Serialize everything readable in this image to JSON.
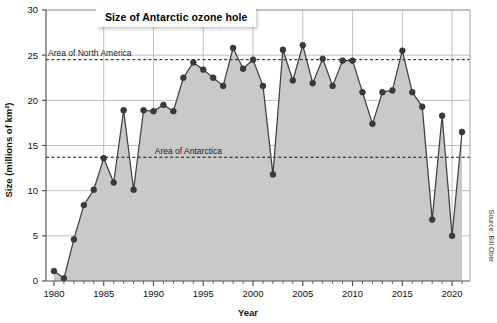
{
  "chart_data": {
    "type": "area",
    "title": "Size of Antarctic ozone hole",
    "xlabel": "Year",
    "ylabel": "Size (millions of km²)",
    "xlim": [
      1979.2,
      2021.8
    ],
    "ylim": [
      0,
      30
    ],
    "grid": true,
    "legend_position": "none",
    "source": "Source: Bill Ober",
    "x_ticks": [
      1980,
      1985,
      1990,
      1995,
      2000,
      2005,
      2010,
      2015,
      2020
    ],
    "x_tick_labels": [
      "1980",
      "1985",
      "1990",
      "1995",
      "2000",
      "2005",
      "2010",
      "2015",
      "2020"
    ],
    "y_ticks": [
      0,
      5,
      10,
      15,
      20,
      25,
      30
    ],
    "y_tick_labels": [
      "0",
      "5",
      "10",
      "15",
      "20",
      "25",
      "30"
    ],
    "x": [
      1980,
      1981,
      1982,
      1983,
      1984,
      1985,
      1986,
      1987,
      1988,
      1989,
      1990,
      1991,
      1992,
      1993,
      1994,
      1995,
      1996,
      1997,
      1998,
      1999,
      2000,
      2001,
      2002,
      2003,
      2004,
      2005,
      2006,
      2007,
      2008,
      2009,
      2010,
      2011,
      2012,
      2013,
      2014,
      2015,
      2016,
      2017,
      2018,
      2019,
      2020,
      2021
    ],
    "values": [
      1.1,
      0.3,
      4.6,
      8.4,
      10.1,
      13.6,
      10.9,
      18.9,
      10.1,
      18.9,
      18.8,
      19.5,
      18.8,
      22.5,
      24.2,
      23.4,
      22.5,
      21.6,
      25.8,
      23.5,
      24.5,
      21.6,
      11.8,
      25.6,
      22.2,
      26.1,
      21.9,
      24.6,
      21.6,
      24.4,
      24.4,
      20.9,
      17.4,
      20.9,
      21.1,
      25.5,
      20.9,
      19.3,
      6.8,
      18.3,
      5.0,
      16.5
    ],
    "reference_lines": [
      {
        "label": "Area of North America",
        "value": 24.5,
        "label_x": 1983.6
      },
      {
        "label": "Area of Antarctica",
        "value": 13.7,
        "label_x": 1993.5
      }
    ],
    "series_color": "#555555",
    "area_fill": "#c9c9c9",
    "grid_color": "#b0b0b0",
    "axis_color": "#555555"
  }
}
